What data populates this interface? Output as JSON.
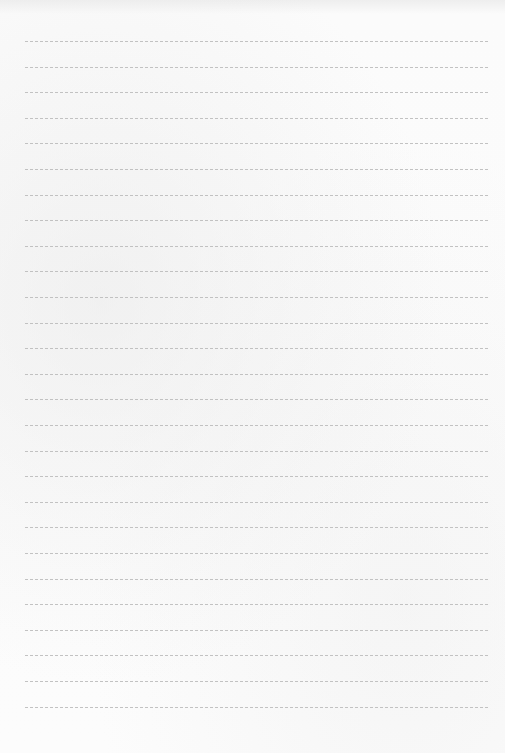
{
  "page": {
    "type": "lined-paper",
    "line_count": 27,
    "first_line_y": 41,
    "line_spacing": 25.6,
    "line_left": 25,
    "line_right": 488,
    "colors": {
      "paper": "#fcfcfc",
      "rule": "#b9b9b9"
    }
  }
}
